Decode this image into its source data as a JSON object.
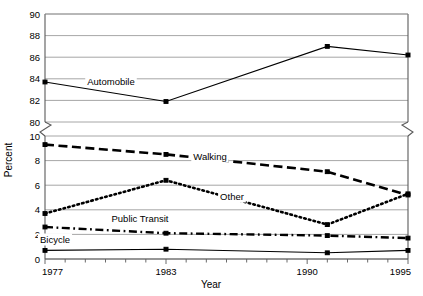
{
  "chart_data": {
    "type": "line",
    "title": "",
    "xlabel": "Year",
    "ylabel": "Percent",
    "grid": true,
    "legend_position": "inline-labels",
    "axis_break": true,
    "x": [
      1977,
      1983,
      1991,
      1995
    ],
    "xtick_labels": [
      "1977",
      "1983",
      "1990",
      "1995"
    ],
    "xlim": [
      1977,
      1995
    ],
    "upper_panel": {
      "ylim": [
        80,
        90
      ],
      "yticks": [
        80,
        82,
        84,
        86,
        88,
        90
      ],
      "ytick_labels": [
        "80",
        "82",
        "84",
        "86",
        "88",
        "90"
      ]
    },
    "lower_panel": {
      "ylim": [
        0,
        10
      ],
      "yticks": [
        0,
        2,
        4,
        6,
        8,
        10
      ],
      "ytick_labels": [
        "0",
        "2",
        "4",
        "6",
        "8",
        "10"
      ]
    },
    "series": [
      {
        "name": "Automobile",
        "label": "Automobile",
        "panel": "upper",
        "linestyle": "solid",
        "values": [
          83.7,
          81.9,
          87.0,
          86.2
        ]
      },
      {
        "name": "Walking",
        "label": "Walking",
        "panel": "lower",
        "linestyle": "dashed",
        "values": [
          9.3,
          8.5,
          7.1,
          5.2
        ]
      },
      {
        "name": "Other",
        "label": "Other",
        "panel": "lower",
        "linestyle": "dotted",
        "values": [
          3.7,
          6.4,
          2.8,
          5.3
        ]
      },
      {
        "name": "Public Transit",
        "label": "Public Transit",
        "panel": "lower",
        "linestyle": "dash-dot",
        "values": [
          2.6,
          2.1,
          1.9,
          1.7
        ]
      },
      {
        "name": "Bicycle",
        "label": "Bicycle",
        "panel": "lower",
        "linestyle": "solid",
        "values": [
          0.7,
          0.8,
          0.5,
          0.7
        ]
      }
    ],
    "annotations": [
      {
        "text": "Automobile",
        "x": 111,
        "y": 85
      },
      {
        "text": "Walking",
        "x": 210,
        "y": 160
      },
      {
        "text": "Other",
        "x": 232,
        "y": 200
      },
      {
        "text": "Public Transit",
        "x": 140,
        "y": 222
      },
      {
        "text": "Bicycle",
        "x": 55,
        "y": 243
      }
    ],
    "colors": {
      "line": "#000000",
      "grid": "#8f8f8f",
      "axis": "#5a5a5a",
      "background": "#ffffff"
    }
  }
}
